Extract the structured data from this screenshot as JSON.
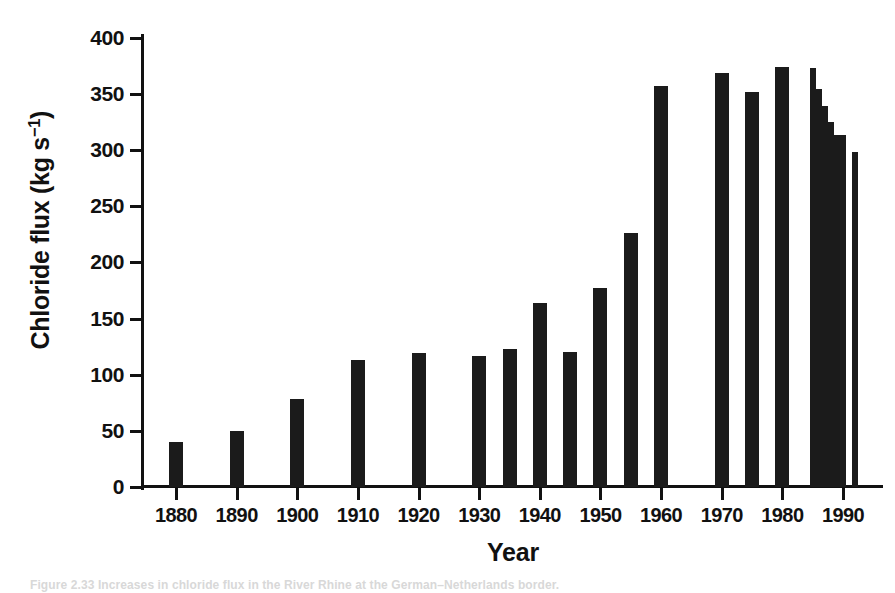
{
  "figure": {
    "background_color": "#ffffff",
    "ink_color": "#1b1b1b",
    "caption": "Figure 2.33  Increases in chloride flux in the River Rhine at the German–Netherlands border."
  },
  "axes": {
    "y_title_main": "Chloride flux  (kg s",
    "y_title_exponent": "−1",
    "y_title_close": ")",
    "y_title_plain": "Chloride flux (kg s−1)",
    "x_title": "Year",
    "y_ticks": [
      "400",
      "350",
      "300",
      "250",
      "200",
      "150",
      "100",
      "50",
      "0"
    ],
    "y_tick_values": [
      400,
      350,
      300,
      250,
      200,
      150,
      100,
      50,
      0
    ],
    "x_ticks": [
      "1880",
      "1890",
      "1900",
      "1910",
      "1920",
      "1930",
      "1940",
      "1950",
      "1960",
      "1970",
      "1980",
      "1990"
    ],
    "x_tick_values": [
      1880,
      1890,
      1900,
      1910,
      1920,
      1930,
      1940,
      1950,
      1960,
      1970,
      1980,
      1990
    ]
  },
  "chart_data": {
    "type": "bar",
    "title": "",
    "subtitle": "",
    "xlabel": "Year",
    "ylabel": "Chloride flux (kg s−1)",
    "xlim": [
      1873,
      1997
    ],
    "ylim": [
      0,
      400
    ],
    "ytick_step": 50,
    "grid": false,
    "legend": null,
    "bar_color": "#1b1b1b",
    "categories": [
      1880,
      1890,
      1900,
      1910,
      1920,
      1930,
      1935,
      1940,
      1945,
      1950,
      1955,
      1960,
      1970,
      1975,
      1980,
      1985,
      1986,
      1987,
      1988,
      1989,
      1990,
      1991,
      1992,
      1993
    ],
    "values": [
      40,
      50,
      78,
      113,
      119,
      117,
      123,
      164,
      120,
      177,
      226,
      357,
      369,
      352,
      374,
      373,
      354,
      339,
      325,
      313,
      313,
      313,
      298,
      298
    ],
    "bars": [
      {
        "year": 1880,
        "value": 40,
        "width_px": 14
      },
      {
        "year": 1890,
        "value": 50,
        "width_px": 14
      },
      {
        "year": 1900,
        "value": 78,
        "width_px": 14
      },
      {
        "year": 1910,
        "value": 113,
        "width_px": 14
      },
      {
        "year": 1920,
        "value": 119,
        "width_px": 14
      },
      {
        "year": 1930,
        "value": 117,
        "width_px": 14
      },
      {
        "year": 1935,
        "value": 123,
        "width_px": 14
      },
      {
        "year": 1940,
        "value": 164,
        "width_px": 14
      },
      {
        "year": 1945,
        "value": 120,
        "width_px": 14
      },
      {
        "year": 1950,
        "value": 177,
        "width_px": 14
      },
      {
        "year": 1955,
        "value": 226,
        "width_px": 14
      },
      {
        "year": 1960,
        "value": 357,
        "width_px": 14
      },
      {
        "year": 1970,
        "value": 369,
        "width_px": 14
      },
      {
        "year": 1975,
        "value": 352,
        "width_px": 14
      },
      {
        "year": 1980,
        "value": 374,
        "width_px": 14
      },
      {
        "year": 1985,
        "value": 373,
        "width_px": 6
      },
      {
        "year": 1986,
        "value": 354,
        "width_px": 6
      },
      {
        "year": 1987,
        "value": 339,
        "width_px": 6
      },
      {
        "year": 1988,
        "value": 325,
        "width_px": 6
      },
      {
        "year": 1989,
        "value": 313,
        "width_px": 6
      },
      {
        "year": 1990,
        "value": 313,
        "width_px": 6
      },
      {
        "year": 1992,
        "value": 298,
        "width_px": 6
      }
    ]
  }
}
